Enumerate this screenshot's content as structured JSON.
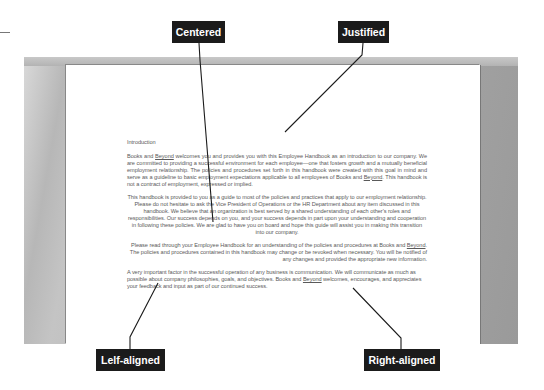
{
  "callouts": {
    "centered": "Centered",
    "justified": "Justified",
    "left_aligned": "Lelf-aligned",
    "right_aligned": "Right-aligned"
  },
  "document": {
    "heading": "Introduction",
    "company_name": "Beyond",
    "paragraphs": [
      {
        "alignment": "justified",
        "before": "Books and ",
        "link": "Beyond",
        "after": " welcomes you and provides you with this Employee Handbook as an introduction to our company. We are committed to providing a successful environment for each employee—one that fosters growth and a mutually beneficial employment relationship. The policies and procedures set forth in this handbook were created with this goal in mind and serve as a guideline to basic employment expectations applicable to all employees of Books and ",
        "link2": "Beyond",
        "after2": ". This handbook is not a contract of employment, expressed or implied."
      },
      {
        "alignment": "centered",
        "text": "This handbook is provided to you as a guide to most of the policies and practices that apply to our employment relationship. Please do not hesitate to ask the Vice President of Operations or the HR Department about any item discussed in this handbook. We believe that an organization is best served by a shared understanding of each other's roles and responsibilities. Our success depends on you, and your success depends in part upon your understanding and cooperation in following these policies. We are glad to have you on board and hope this guide will assist you in making this transition into our company."
      },
      {
        "alignment": "right",
        "before": "Please read through your Employee Handbook for an understanding of the policies and procedures at Books and ",
        "link": "Beyond",
        "after": ". The policies and procedures contained in this handbook may change or be revoked when necessary. You will be notified of any changes and provided the appropriate new information."
      },
      {
        "alignment": "left",
        "before": "A very important factor in the successful operation of any business is communication. We will communicate as much as possible about company philosophies, goals, and objectives. Books and ",
        "link": "Beyond",
        "after": " welcomes, encourages, and appreciates your feedback and input as part of our continued success."
      }
    ]
  },
  "colors": {
    "callout_bg": "#1b1b1b",
    "callout_text": "#ffffff",
    "frame_gray": "#a9a9a9",
    "page_bg": "#ffffff",
    "body_text": "#5a5a5a"
  }
}
